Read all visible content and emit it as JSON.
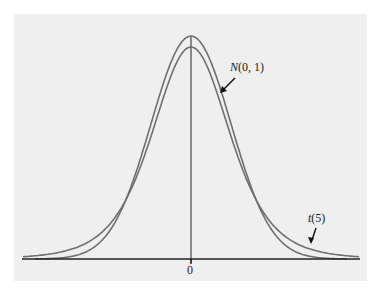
{
  "chart_data": {
    "type": "line",
    "title": "",
    "xlabel": "",
    "ylabel": "",
    "x_ticks": [
      "0"
    ],
    "grid": false,
    "legend": "annotations with arrows",
    "series": [
      {
        "name": "N(0, 1)",
        "label_italic": "N",
        "label_rest": "(0, 1)",
        "distribution": "standard normal",
        "peak_density": 0.399,
        "color": "#6f6f6f"
      },
      {
        "name": "t(5)",
        "label_italic": "t",
        "label_rest": "(5)",
        "distribution": "t with 5 degrees of freedom",
        "peak_density": 0.38,
        "color": "#6f6f6f"
      }
    ],
    "annotations": [
      {
        "text": "N(0, 1)",
        "points_to": "normal curve upper right of peak"
      },
      {
        "text": "t(5)",
        "points_to": "t curve heavier right tail"
      }
    ],
    "center_line_x": 0,
    "x_range": [
      -4.2,
      4.2
    ]
  },
  "colors": {
    "background": "#efefef",
    "curve": "#6f6f6f",
    "axis": "#222222"
  }
}
